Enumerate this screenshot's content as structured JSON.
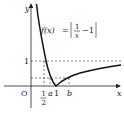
{
  "diagram": {
    "function_label": {
      "lhs": "f(x)",
      "eq": "=",
      "frac_num": "1",
      "frac_den": "x",
      "minus": "−",
      "const": "1"
    },
    "axes": {
      "x_label": "x",
      "y_label": "y",
      "origin_label": "O"
    },
    "ticks": {
      "y_one": "1",
      "x_half_num": "1",
      "x_half_den": "2",
      "x_a": "a",
      "x_one": "1",
      "x_b": "b"
    },
    "colors": {
      "curve": "#111111",
      "axis": "#222222",
      "dashed": "#444444"
    }
  }
}
